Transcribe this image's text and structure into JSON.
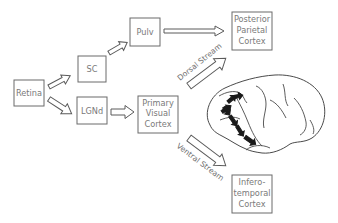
{
  "diagram": {
    "nodes": {
      "retina": {
        "label": "Retina"
      },
      "sc": {
        "label": "SC"
      },
      "lgnd": {
        "label": "LGNd"
      },
      "pulv": {
        "label": "Pulv"
      },
      "v1": {
        "lines": [
          "Primary",
          "Visual",
          "Cortex"
        ]
      },
      "ppc": {
        "lines": [
          "Posterior",
          "Parietal",
          "Cortex"
        ]
      },
      "it": {
        "lines": [
          "Infero-",
          "temporal",
          "Cortex"
        ]
      }
    },
    "streams": {
      "dorsal": "Dorsal Stream",
      "ventral": "Ventral Stream"
    },
    "edges": [
      {
        "from": "Retina",
        "to": "SC"
      },
      {
        "from": "Retina",
        "to": "LGNd"
      },
      {
        "from": "SC",
        "to": "Pulv"
      },
      {
        "from": "Pulv",
        "to": "Posterior Parietal Cortex"
      },
      {
        "from": "LGNd",
        "to": "Primary Visual Cortex"
      },
      {
        "from": "Primary Visual Cortex",
        "to": "Posterior Parietal Cortex",
        "via": "Dorsal Stream"
      },
      {
        "from": "Primary Visual Cortex",
        "to": "Inferotemporal Cortex",
        "via": "Ventral Stream"
      }
    ],
    "illustration": "macaque-brain-lateral-view"
  }
}
